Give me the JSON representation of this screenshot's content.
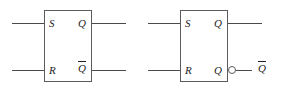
{
  "figure": {
    "type": "logic-diagram",
    "background_color": "#ffffff",
    "line_color": "#4a4a4a",
    "border_color": "#5c5c5c",
    "text_color": "#1d1d1d"
  },
  "blocks": [
    {
      "id": "sr-latch-left",
      "name": "SR latch with complemented Q output label",
      "inputs": [
        {
          "label": "S",
          "overbar": false
        },
        {
          "label": "R",
          "overbar": false
        }
      ],
      "outputs": [
        {
          "label": "Q",
          "overbar": false,
          "bubble": false
        },
        {
          "label": "Q",
          "overbar": true,
          "bubble": false
        }
      ]
    },
    {
      "id": "sr-latch-right",
      "name": "SR latch with inversion bubble on lower Q output",
      "inputs": [
        {
          "label": "S",
          "overbar": false
        },
        {
          "label": "R",
          "overbar": false
        }
      ],
      "outputs": [
        {
          "label": "Q",
          "overbar": false,
          "bubble": false
        },
        {
          "label": "Q",
          "overbar": false,
          "bubble": true
        }
      ],
      "external_labels": [
        {
          "label": "Q",
          "overbar": true
        }
      ]
    }
  ]
}
